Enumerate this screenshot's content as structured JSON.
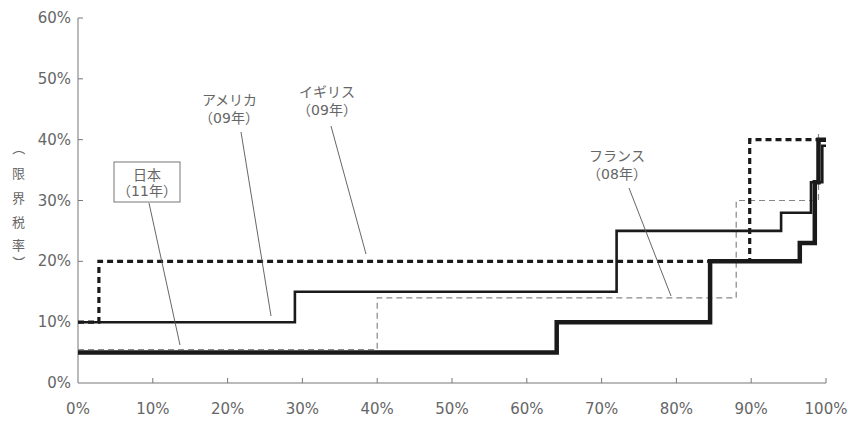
{
  "chart_data": {
    "type": "line",
    "subtype": "step",
    "title": "",
    "xlabel": "",
    "ylabel": "（限界税率）",
    "ylabel_chars": [
      "（",
      "限",
      "界",
      "税",
      "率",
      "）"
    ],
    "xlim": [
      0,
      100
    ],
    "ylim": [
      0,
      60
    ],
    "x_ticks": [
      "0%",
      "10%",
      "20%",
      "30%",
      "40%",
      "50%",
      "60%",
      "70%",
      "80%",
      "90%",
      "100%"
    ],
    "y_ticks": [
      "0%",
      "10%",
      "20%",
      "30%",
      "40%",
      "50%",
      "60%"
    ],
    "grid": false,
    "legend": "annotations with leader lines",
    "series": [
      {
        "name": "日本（11年）",
        "label_lines": [
          "日本",
          "（11年）"
        ],
        "boxed": true,
        "style": "thick-solid",
        "color": "#1a1a1a",
        "x": [
          0,
          64,
          64,
          84.5,
          84.5,
          96.5,
          96.5,
          98.5,
          98.5,
          99,
          99,
          100
        ],
        "y": [
          5,
          5,
          10,
          10,
          20,
          20,
          23,
          23,
          33,
          33,
          40,
          40
        ]
      },
      {
        "name": "アメリカ（09年）",
        "label_lines": [
          "アメリカ",
          "（09年）"
        ],
        "boxed": false,
        "style": "solid",
        "color": "#1a1a1a",
        "x": [
          0,
          29,
          29,
          72,
          72,
          94,
          94,
          98,
          98,
          99.5,
          99.5,
          100
        ],
        "y": [
          10,
          10,
          15,
          15,
          25,
          25,
          28,
          28,
          33,
          33,
          39,
          39
        ]
      },
      {
        "name": "イギリス（09年）",
        "label_lines": [
          "イギリス",
          "（09年）"
        ],
        "boxed": false,
        "style": "thick-dotted",
        "color": "#1a1a1a",
        "x": [
          0,
          2.8,
          2.8,
          89.8,
          89.8,
          100
        ],
        "y": [
          10,
          10,
          20,
          20,
          40,
          40
        ]
      },
      {
        "name": "フランス（08年）",
        "label_lines": [
          "フランス",
          "（08年）"
        ],
        "boxed": false,
        "style": "thin-dashed",
        "color": "#888888",
        "x": [
          0,
          40,
          40,
          88,
          88,
          99,
          99
        ],
        "y": [
          5.5,
          5.5,
          14,
          14,
          30,
          30,
          41
        ]
      }
    ]
  }
}
